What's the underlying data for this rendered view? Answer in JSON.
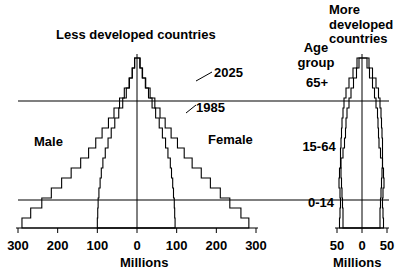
{
  "titles": {
    "left_panel": "Less developed countries",
    "right_panel": "More\ndeveloped\ncountries",
    "age_group_heading": "Age\ngroup"
  },
  "age_groups": [
    {
      "label": "65+",
      "id": "65plus"
    },
    {
      "label": "15-64",
      "id": "15-64"
    },
    {
      "label": "0-14",
      "id": "0-14"
    }
  ],
  "sex_labels": {
    "male": "Male",
    "female": "Female"
  },
  "series_labels": [
    {
      "label": "2025",
      "id": "year-2025"
    },
    {
      "label": "1985",
      "id": "year-1985"
    }
  ],
  "axes": {
    "left": {
      "unit_label": "Millions",
      "ticks": [
        "300",
        "200",
        "100",
        "0",
        "100",
        "200",
        "300"
      ],
      "tick_values": [
        -300,
        -200,
        -100,
        0,
        100,
        200,
        300
      ],
      "max": 300
    },
    "right": {
      "unit_label": "Millions",
      "ticks": [
        "50",
        "0",
        "50"
      ],
      "tick_values": [
        -50,
        0,
        50
      ],
      "max": 50
    }
  },
  "style": {
    "line_color": "#000000",
    "axis_color": "#000000",
    "background": "#ffffff"
  },
  "chart_data": {
    "type": "bar",
    "xlabel": "Millions",
    "ylabel": "Age group",
    "grid": false,
    "legend": [
      "1985",
      "2025"
    ],
    "legend_position": "inline-annotation",
    "age_bands": [
      "0-4",
      "5-9",
      "10-14",
      "15-19",
      "20-24",
      "25-29",
      "30-34",
      "35-39",
      "40-44",
      "45-49",
      "50-54",
      "55-59",
      "60-64",
      "65-69",
      "70-74",
      "75-79",
      "80+"
    ],
    "panels": [
      {
        "name": "Less developed countries",
        "xlim": [
          -300,
          300
        ],
        "series": [
          {
            "name": "1985",
            "male": [
              290,
              268,
              240,
              216,
              190,
              166,
              142,
              122,
              104,
              88,
              72,
              58,
              44,
              32,
              20,
              12,
              6
            ],
            "female": [
              282,
              262,
              234,
              210,
              185,
              162,
              139,
              119,
              102,
              86,
              71,
              58,
              45,
              33,
              22,
              13,
              7
            ]
          },
          {
            "name": "2025",
            "male": [
              100,
              99,
              98,
              96,
              93,
              90,
              86,
              80,
              73,
              65,
              56,
              46,
              36,
              27,
              19,
              12,
              6
            ],
            "female": [
              96,
              95,
              94,
              92,
              90,
              87,
              84,
              78,
              72,
              64,
              56,
              47,
              38,
              29,
              21,
              14,
              8
            ]
          }
        ]
      },
      {
        "name": "More developed countries",
        "xlim": [
          -50,
          50
        ],
        "series": [
          {
            "name": "1985",
            "male": [
              45,
              44,
              43,
              44,
              46,
              45,
              42,
              38,
              35,
              33,
              32,
              30,
              26,
              22,
              17,
              11,
              6
            ],
            "female": [
              43,
              42,
              41,
              42,
              44,
              43,
              41,
              37,
              34,
              33,
              32,
              31,
              28,
              25,
              21,
              15,
              10
            ]
          },
          {
            "name": "2025",
            "male": [
              38,
              38,
              39,
              40,
              41,
              42,
              43,
              43,
              42,
              41,
              40,
              38,
              36,
              32,
              26,
              18,
              10
            ],
            "female": [
              36,
              36,
              37,
              38,
              39,
              40,
              41,
              41,
              41,
              40,
              39,
              38,
              36,
              33,
              28,
              21,
              14
            ]
          }
        ]
      }
    ]
  }
}
